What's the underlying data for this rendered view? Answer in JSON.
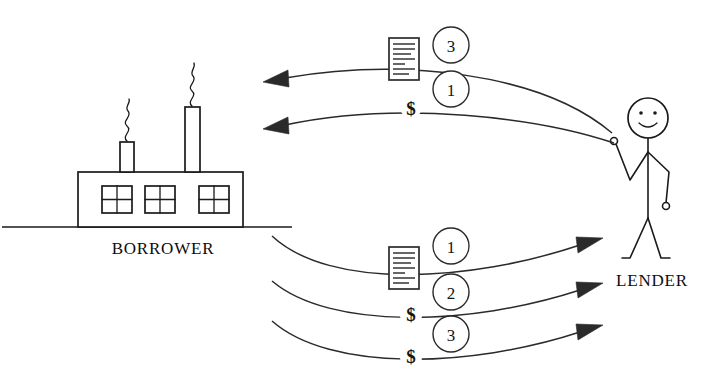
{
  "diagram": {
    "background_color": "#ffffff",
    "ink_color": "#1a1a1a",
    "width": 719,
    "height": 385
  },
  "nodes": {
    "borrower": {
      "label": "BORROWER",
      "icon": "factory-icon",
      "windows": 3,
      "smokestacks": 2
    },
    "lender": {
      "label": "LENDER",
      "icon": "stick-figure-person-icon",
      "expression": "smiling"
    }
  },
  "flows": {
    "to_borrower": [
      {
        "id": "flow-lender-to-borrower-document",
        "badge": "3",
        "payload_icon": "document-icon",
        "payload_label": "",
        "direction": "lender-to-borrower"
      },
      {
        "id": "flow-lender-to-borrower-money",
        "badge": "1",
        "payload_icon": "dollar-icon",
        "payload_label": "$",
        "direction": "lender-to-borrower"
      }
    ],
    "to_lender": [
      {
        "id": "flow-borrower-to-lender-document",
        "badge": "1",
        "payload_icon": "document-icon",
        "payload_label": "",
        "direction": "borrower-to-lender"
      },
      {
        "id": "flow-borrower-to-lender-money-1",
        "badge": "2",
        "payload_icon": "dollar-icon",
        "payload_label": "$",
        "direction": "borrower-to-lender"
      },
      {
        "id": "flow-borrower-to-lender-money-2",
        "badge": "3",
        "payload_icon": "dollar-icon",
        "payload_label": "$",
        "direction": "borrower-to-lender"
      }
    ]
  }
}
